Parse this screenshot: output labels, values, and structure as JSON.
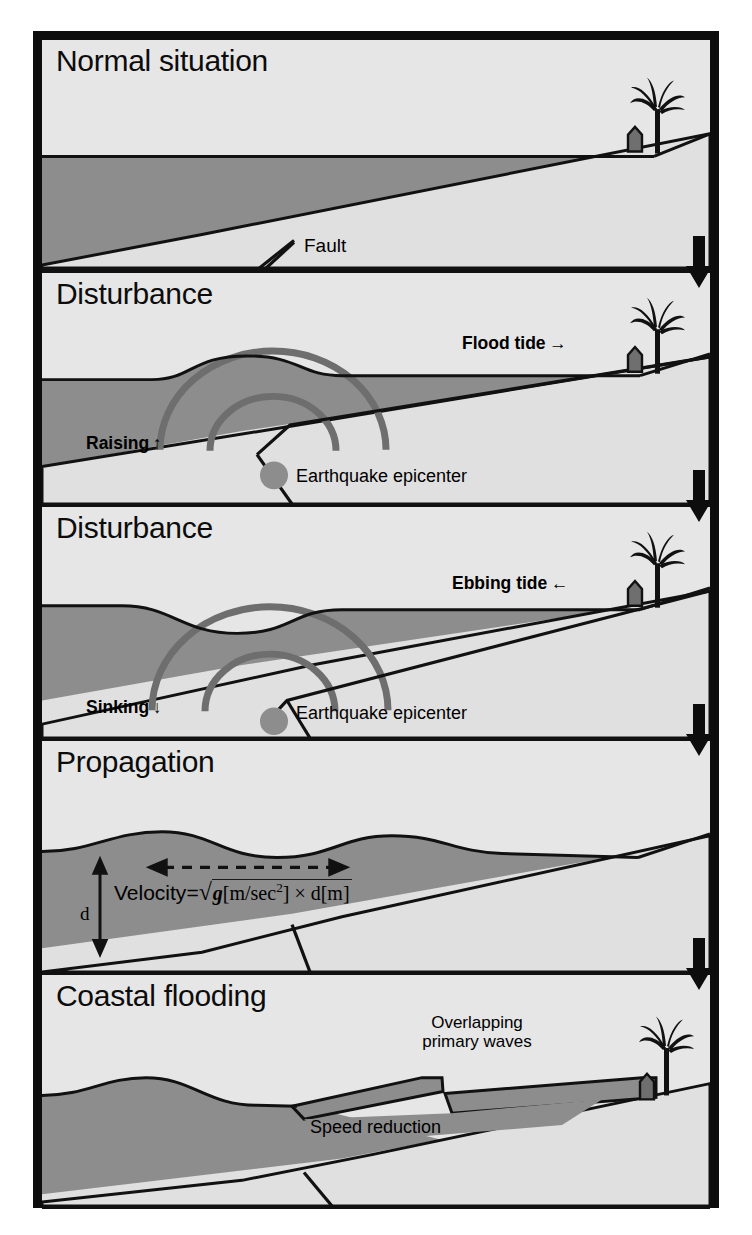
{
  "figure": {
    "title_implied": "Tsunami generation and propagation stages",
    "border_color": "#0d0d0d",
    "colors": {
      "sky": "#e6e6e6",
      "land": "#e0e0e0",
      "water": "#8d8d8d",
      "wave_ring": "#6e6e6e",
      "epicenter_dot": "#8a8a8a",
      "outline": "#111111",
      "text": "#0c0c0c"
    }
  },
  "panels": [
    {
      "id": "normal-situation",
      "title": "Normal situation",
      "labels": [
        {
          "name": "fault-label",
          "text": "Fault"
        }
      ],
      "features": [
        "sea surface flat",
        "sloping seabed",
        "fault line",
        "coastal house",
        "palm tree"
      ]
    },
    {
      "id": "disturbance-raising",
      "title": "Disturbance",
      "labels": [
        {
          "name": "flood-tide-label",
          "text": "Flood tide →"
        },
        {
          "name": "raising-label",
          "text": "Raising ↑"
        },
        {
          "name": "epicenter-label",
          "text": "Earthquake epicenter"
        }
      ],
      "features": [
        "sea surface bulge",
        "two seismic wave arcs",
        "upthrust fault block",
        "epicenter dot"
      ]
    },
    {
      "id": "disturbance-sinking",
      "title": "Disturbance",
      "labels": [
        {
          "name": "ebbing-tide-label",
          "text": "Ebbing tide ←"
        },
        {
          "name": "sinking-label",
          "text": "Sinking ↓"
        },
        {
          "name": "epicenter-label",
          "text": "Earthquake epicenter"
        }
      ],
      "features": [
        "sea surface depression",
        "two seismic wave arcs",
        "downthrust fault block",
        "epicenter dot"
      ]
    },
    {
      "id": "propagation",
      "title": "Propagation",
      "labels": [
        {
          "name": "depth-label",
          "text": "d"
        }
      ],
      "formula": {
        "name": "velocity-formula",
        "lhs": "Velocity",
        "equals": "=",
        "radicand_g": "g",
        "unit_g": "[m/sec",
        "unit_g_sup": "2",
        "unit_g_close": "]",
        "times": "×",
        "radicand_d": "d",
        "unit_d": "[m]",
        "plain": "Velocity = √( g[m/sec²] × d[m] )"
      },
      "features": [
        "travelling wave train",
        "horizontal dashed double arrow",
        "vertical depth arrow d"
      ]
    },
    {
      "id": "coastal-flooding",
      "title": "Coastal flooding",
      "labels": [
        {
          "name": "overlapping-waves-label-line1",
          "text": "Overlapping"
        },
        {
          "name": "overlapping-waves-label-line2",
          "text": "primary waves"
        },
        {
          "name": "speed-reduction-label",
          "text": "Speed reduction"
        }
      ],
      "features": [
        "wave shoaling",
        "stepped overlapping crest",
        "run-up onto shore",
        "house inundated"
      ]
    }
  ],
  "flow_arrows": {
    "name": "stage-flow-arrow",
    "direction": "down",
    "count": 4
  }
}
